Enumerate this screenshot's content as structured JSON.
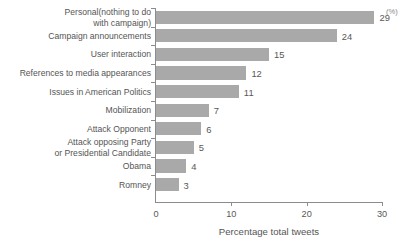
{
  "chart_data": {
    "type": "bar",
    "orientation": "horizontal",
    "title": "",
    "xlabel": "Percentage total tweets",
    "ylabel": "",
    "xunit": "(%)",
    "xlim": [
      0,
      30
    ],
    "xticks": [
      0,
      10,
      20,
      30
    ],
    "xtick_labels": [
      "0",
      "10",
      "20",
      "30"
    ],
    "grid": false,
    "legend": null,
    "bar_color": "#a9a9a9",
    "axis_color": "#8c8c8c",
    "text_color": "#555555",
    "categories": [
      "Personal(nothing to do\nwith campaign)",
      "Campaign announcements",
      "User interaction",
      "References to media appearances",
      "Issues in American Politics",
      "Mobilization",
      "Attack Opponent",
      "Attack opposing Party\nor Presidential Candidate",
      "Obama",
      "Romney"
    ],
    "values": [
      29,
      24,
      15,
      12,
      11,
      7,
      6,
      5,
      4,
      3
    ],
    "value_labels": [
      "29",
      "24",
      "15",
      "12",
      "11",
      "7",
      "6",
      "5",
      "4",
      "3"
    ]
  }
}
